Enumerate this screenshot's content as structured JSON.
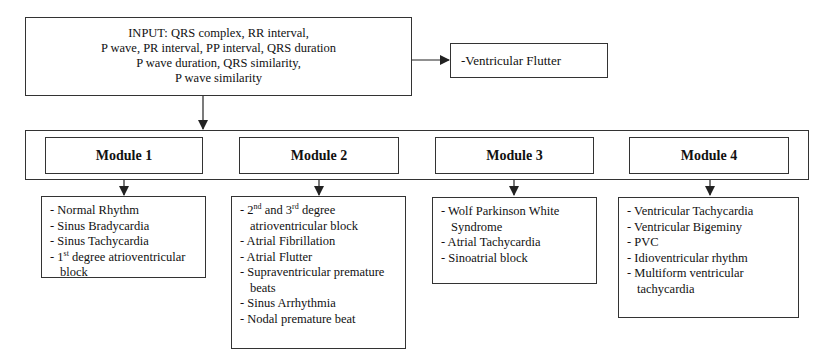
{
  "input": {
    "lines": [
      "INPUT: QRS complex, RR interval,",
      "P wave, PR interval, PP interval, QRS duration",
      "P wave duration, QRS similarity,",
      "P wave similarity"
    ]
  },
  "side_output": {
    "label": "-Ventricular Flutter"
  },
  "modules": [
    {
      "title": "Module 1",
      "items": [
        {
          "text": "Normal Rhythm"
        },
        {
          "text": "Sinus Bradycardia"
        },
        {
          "text": "Sinus Tachycardia"
        },
        {
          "pre": "1",
          "sup": "st",
          "text": " degree atrioventricular block"
        }
      ]
    },
    {
      "title": "Module 2",
      "items": [
        {
          "pre": "2",
          "sup": "nd",
          "mid": " and 3",
          "sup2": "rd",
          "text": " degree atrioventricular block"
        },
        {
          "text": "Atrial Fibrillation"
        },
        {
          "text": "Atrial Flutter"
        },
        {
          "text": "Supraventricular premature beats"
        },
        {
          "text": "Sinus Arrhythmia"
        },
        {
          "text": "Nodal premature beat"
        }
      ]
    },
    {
      "title": "Module 3",
      "items": [
        {
          "text": "Wolf Parkinson White Syndrome"
        },
        {
          "text": "Atrial Tachycardia"
        },
        {
          "text": "Sinoatrial block"
        }
      ]
    },
    {
      "title": "Module 4",
      "items": [
        {
          "text": "Ventricular Tachycardia"
        },
        {
          "text": "Ventricular Bigeminy"
        },
        {
          "text": "PVC"
        },
        {
          "text": "Idioventricular rhythm"
        },
        {
          "text": "Multiform ventricular tachycardia"
        }
      ]
    }
  ],
  "colors": {
    "stroke": "#333333",
    "text": "#111111",
    "background": "#ffffff"
  }
}
